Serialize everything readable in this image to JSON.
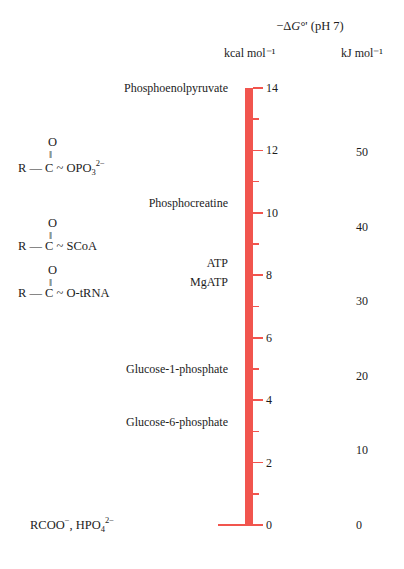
{
  "header": {
    "axis_title_prefix": "−Δ",
    "axis_title_symbol": "G",
    "axis_title_suffix": "°' (pH 7)",
    "axis_title_full": "−ΔG°' (pH 7)",
    "unit_left": "kcal mol⁻¹",
    "unit_right": "kJ mol⁻¹"
  },
  "colors": {
    "bar": "#f1554e",
    "text": "#1c1c1c",
    "background": "#ffffff"
  },
  "chart_data": {
    "type": "bar",
    "title": "−ΔG°' (pH 7)",
    "xlabel": "",
    "ylabel": "kcal mol⁻¹",
    "ylabel_secondary": "kJ mol⁻¹",
    "ylim": [
      0,
      14
    ],
    "ylim_secondary": [
      0,
      58.6
    ],
    "grid": false,
    "legend": "none",
    "orientation": "vertical",
    "kcal_major_ticks": [
      0,
      2,
      4,
      6,
      8,
      10,
      12,
      14
    ],
    "kcal_minor_ticks": [
      1,
      3,
      5,
      7,
      9,
      11,
      13
    ],
    "kj_ticks": [
      0,
      10,
      20,
      30,
      40,
      50
    ],
    "categories": [
      "Phosphoenolpyruvate",
      "Acyl phosphate",
      "Phosphocreatine",
      "Thioester",
      "ATP",
      "Aminoacyl-tRNA",
      "MgATP",
      "Glucose-1-phosphate",
      "Glucose-6-phosphate",
      "RCOO⁻, HPO₄²⁻"
    ],
    "values": [
      14.0,
      11.8,
      10.3,
      9.3,
      8.4,
      7.8,
      7.8,
      5.0,
      3.3,
      0.0
    ]
  },
  "kcal_ticks": [
    {
      "value": 14,
      "label": "14",
      "major": true
    },
    {
      "value": 13,
      "label": "",
      "major": false
    },
    {
      "value": 12,
      "label": "12",
      "major": true
    },
    {
      "value": 11,
      "label": "",
      "major": false
    },
    {
      "value": 10,
      "label": "10",
      "major": true
    },
    {
      "value": 9,
      "label": "",
      "major": false
    },
    {
      "value": 8,
      "label": "8",
      "major": true
    },
    {
      "value": 7,
      "label": "",
      "major": false
    },
    {
      "value": 6,
      "label": "6",
      "major": true
    },
    {
      "value": 5,
      "label": "",
      "major": false
    },
    {
      "value": 4,
      "label": "4",
      "major": true
    },
    {
      "value": 3,
      "label": "",
      "major": false
    },
    {
      "value": 2,
      "label": "2",
      "major": true
    },
    {
      "value": 1,
      "label": "",
      "major": false
    },
    {
      "value": 0,
      "label": "0",
      "major": true
    }
  ],
  "kj_ticks": [
    {
      "value": 50,
      "label": "50"
    },
    {
      "value": 40,
      "label": "40"
    },
    {
      "value": 30,
      "label": "30"
    },
    {
      "value": 20,
      "label": "20"
    },
    {
      "value": 10,
      "label": "10"
    },
    {
      "value": 0,
      "label": "0"
    }
  ],
  "compounds": [
    {
      "name": "Phosphoenolpyruvate",
      "kcal": 14.0
    },
    {
      "name": "Phosphocreatine",
      "kcal": 10.3
    },
    {
      "name": "ATP",
      "kcal": 8.4
    },
    {
      "name": "MgATP",
      "kcal": 7.8
    },
    {
      "name": "Glucose-1-phosphate",
      "kcal": 5.0
    },
    {
      "name": "Glucose-6-phosphate",
      "kcal": 3.3
    }
  ],
  "structures": [
    {
      "id": "acyl-phosphate",
      "kcal": 11.8,
      "top_atom": "O",
      "bond": "‖",
      "main": "R — C ~ OPO",
      "sub": "3",
      "sup": "2−",
      "plain": "R—C(=O)~OPO₃²⁻"
    },
    {
      "id": "thioester",
      "kcal": 9.3,
      "top_atom": "O",
      "bond": "‖",
      "main": "R — C ~ SCoA",
      "sub": "",
      "sup": "",
      "plain": "R—C(=O)~SCoA"
    },
    {
      "id": "aminoacyl-trna",
      "kcal": 7.8,
      "top_atom": "O",
      "bond": "‖",
      "main": "R — C ~ O-tRNA",
      "sub": "",
      "sup": "",
      "plain": "R—C(=O)~O-tRNA"
    }
  ],
  "bottom_species": {
    "prefix": "RCOO",
    "prefix_sup": "−",
    "middle": ", HPO",
    "sub": "4",
    "sup": "2−",
    "plain": "RCOO⁻, HPO₄²⁻",
    "kcal": 0.0
  }
}
